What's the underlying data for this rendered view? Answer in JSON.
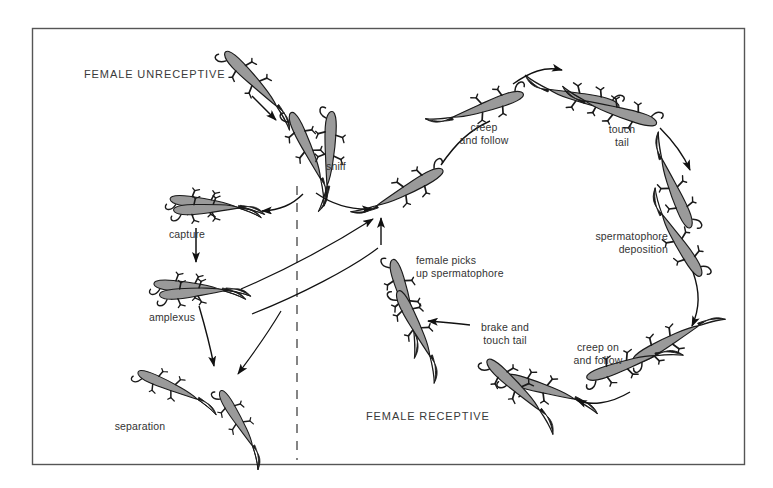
{
  "figure": {
    "background_color": "#ffffff",
    "frame_color": "#555555",
    "animal_fill": "#9a9a9a",
    "animal_outline": "#1a1a1a",
    "arrow_color": "#111111",
    "divider_color": "#666666",
    "label_color": "#333333"
  },
  "headings": {
    "unreceptive": "FEMALE UNRECEPTIVE",
    "receptive": "FEMALE RECEPTIVE"
  },
  "labels": {
    "sniff": "sniff",
    "capture": "capture",
    "amplexus": "amplexus",
    "separation": "separation",
    "creep_and_follow": "creep\nand follow",
    "touch_tail": "touch\ntail",
    "spermatophore_deposition": "spermatophore\ndeposition",
    "creep_on_and_follow": "creep on\nand follow",
    "brake_and_touch_tail": "brake and\ntouch tail",
    "female_picks_up_spermatophore": "female picks\nup spermatophore"
  },
  "sequence_unreceptive": [
    "sniff",
    "capture",
    "amplexus",
    "separation"
  ],
  "sequence_receptive": [
    "sniff",
    "creep and follow",
    "touch tail",
    "spermatophore deposition",
    "creep on and follow",
    "brake and touch tail",
    "female picks up spermatophore"
  ]
}
